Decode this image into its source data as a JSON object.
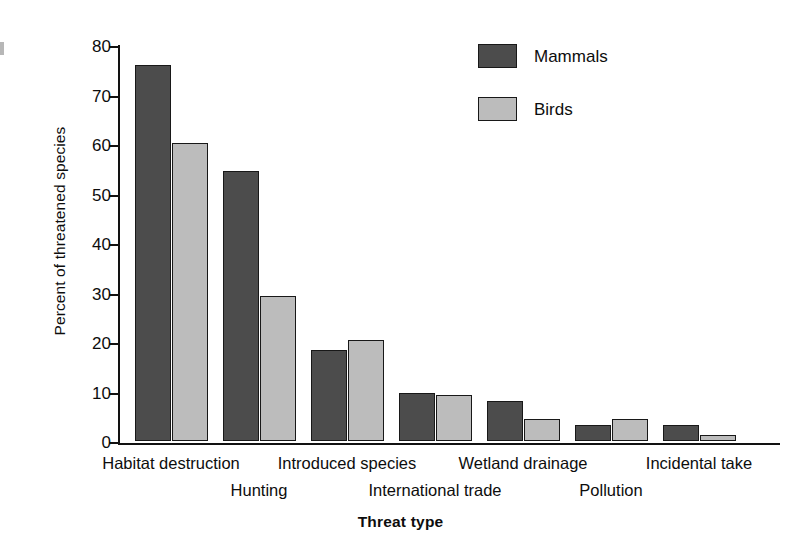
{
  "chart_data": {
    "type": "bar",
    "title": "",
    "xlabel": "Threat type",
    "ylabel": "Percent of threatened species",
    "ylim": [
      0,
      80
    ],
    "yticks": [
      0,
      10,
      20,
      30,
      40,
      50,
      60,
      70,
      80
    ],
    "grid": false,
    "legend_position": "top-right",
    "categories": [
      "Habitat destruction",
      "Hunting",
      "Introduced species",
      "International trade",
      "Wetland drainage",
      "Pollution",
      "Incidental take"
    ],
    "series": [
      {
        "name": "Mammals",
        "color": "#4c4c4c",
        "values": [
          76.0,
          54.5,
          18.3,
          9.8,
          8.1,
          3.3,
          3.3
        ]
      },
      {
        "name": "Birds",
        "color": "#bcbcbc",
        "values": [
          60.3,
          29.2,
          20.4,
          9.3,
          4.4,
          4.5,
          1.3
        ]
      }
    ]
  },
  "axes": {
    "y_title": "Percent of threatened species",
    "x_title": "Threat type",
    "y_tick_labels": [
      "0",
      "10",
      "20",
      "30",
      "40",
      "50",
      "60",
      "70",
      "80"
    ]
  },
  "legend": {
    "items": [
      {
        "label": "Mammals",
        "color": "#4c4c4c"
      },
      {
        "label": "Birds",
        "color": "#bcbcbc"
      }
    ]
  },
  "x_labels": [
    {
      "text": "Habitat destruction",
      "row": "top"
    },
    {
      "text": "Hunting",
      "row": "bottom"
    },
    {
      "text": "Introduced species",
      "row": "top"
    },
    {
      "text": "International trade",
      "row": "bottom"
    },
    {
      "text": "Wetland drainage",
      "row": "top"
    },
    {
      "text": "Pollution",
      "row": "bottom"
    },
    {
      "text": "Incidental take",
      "row": "top"
    }
  ]
}
